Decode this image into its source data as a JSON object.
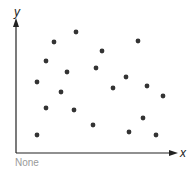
{
  "chart_data": {
    "type": "scatter",
    "title": "",
    "xlabel": "x",
    "ylabel": "y",
    "caption": "None",
    "grid": false,
    "legend": null,
    "points": [
      {
        "x": 21,
        "y": 18
      },
      {
        "x": 30,
        "y": 45
      },
      {
        "x": 21,
        "y": 71
      },
      {
        "x": 30,
        "y": 92
      },
      {
        "x": 38,
        "y": 111
      },
      {
        "x": 60,
        "y": 121
      },
      {
        "x": 51,
        "y": 81
      },
      {
        "x": 45,
        "y": 61
      },
      {
        "x": 58,
        "y": 43
      },
      {
        "x": 80,
        "y": 85
      },
      {
        "x": 86,
        "y": 102
      },
      {
        "x": 77,
        "y": 28
      },
      {
        "x": 97,
        "y": 65
      },
      {
        "x": 110,
        "y": 76
      },
      {
        "x": 122,
        "y": 112
      },
      {
        "x": 113,
        "y": 21
      },
      {
        "x": 131,
        "y": 67
      },
      {
        "x": 127,
        "y": 35
      },
      {
        "x": 140,
        "y": 18
      },
      {
        "x": 147,
        "y": 57
      }
    ],
    "xlim": [
      0,
      162
    ],
    "ylim": [
      0,
      131
    ]
  },
  "labels": {
    "x_axis": "x",
    "y_axis": "y",
    "caption": "None"
  }
}
